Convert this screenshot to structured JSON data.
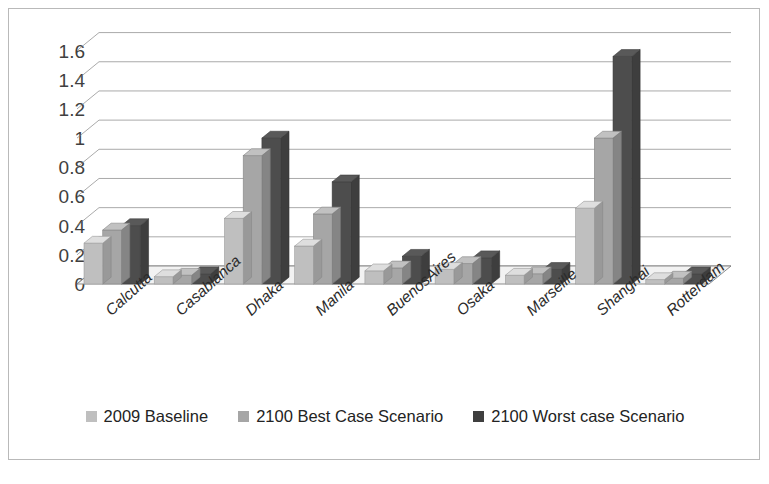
{
  "chart_data": {
    "type": "bar",
    "title": "",
    "subtitle": "",
    "xlabel": "",
    "ylabel": "",
    "ylim": [
      0,
      1.7
    ],
    "yticks": [
      "1.6",
      "1.4",
      "1.2",
      "1",
      "0.8",
      "0.6",
      "0.4",
      "0.2",
      "0"
    ],
    "ytick_values": [
      1.6,
      1.4,
      1.2,
      1,
      0.8,
      0.6,
      0.4,
      0.2,
      0
    ],
    "grid": true,
    "legend_position": "bottom",
    "style": "3d-clustered-column",
    "categories": [
      "Calcutta",
      "Casablanca",
      "Dhaka",
      "Manila",
      "BuenosAires",
      "Osaka",
      "Marseille",
      "Shanghai",
      "Rotterdam"
    ],
    "series": [
      {
        "name": "2009 Baseline",
        "color": "#bfbfbf",
        "values": [
          0.28,
          0.05,
          0.45,
          0.26,
          0.09,
          0.1,
          0.06,
          0.52,
          0.03
        ]
      },
      {
        "name": "2100 Best Case Scenario",
        "color": "#a6a6a6",
        "values": [
          0.37,
          0.06,
          0.88,
          0.48,
          0.11,
          0.14,
          0.07,
          1.0,
          0.04
        ]
      },
      {
        "name": "2100 Worst case Scenario",
        "color": "#4d4d4d",
        "values": [
          0.4,
          0.07,
          1.0,
          0.7,
          0.19,
          0.18,
          0.1,
          1.56,
          0.07
        ]
      }
    ]
  },
  "legend": {
    "items": [
      {
        "label": "2009 Baseline",
        "color": "#bfbfbf"
      },
      {
        "label": "2100 Best Case Scenario",
        "color": "#a6a6a6"
      },
      {
        "label": "2100 Worst case Scenario",
        "color": "#3f3f3f"
      }
    ]
  },
  "caption": {
    "text": ""
  },
  "colors": {
    "frame_border": "#b9b9b9",
    "gridline": "#808080",
    "floor": "#f2f2f2",
    "axis_text": "#404040",
    "category_text": "#2b2b2b"
  }
}
